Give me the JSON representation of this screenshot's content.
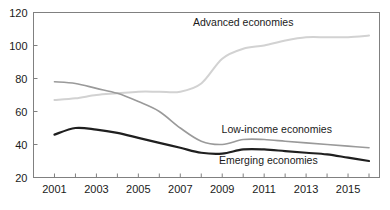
{
  "chart_data": {
    "type": "line",
    "title": "",
    "subtitle": "",
    "xlabel": "",
    "ylabel": "",
    "xlim": [
      2000,
      2016.5
    ],
    "ylim": [
      20,
      120
    ],
    "ytick_values": [
      20,
      40,
      60,
      80,
      100,
      120
    ],
    "ytick_labels": [
      "20",
      "40",
      "60",
      "80",
      "100",
      "120"
    ],
    "xtick_values": [
      2000,
      2001,
      2002,
      2003,
      2004,
      2005,
      2006,
      2007,
      2008,
      2009,
      2010,
      2011,
      2012,
      2013,
      2014,
      2015,
      2016
    ],
    "xtick_labels_shown": [
      "2001",
      "2003",
      "2005",
      "2007",
      "2009",
      "2011",
      "2013",
      "2015"
    ],
    "xtick_labeled_values": [
      2001,
      2003,
      2005,
      2007,
      2009,
      2011,
      2013,
      2015
    ],
    "grid": false,
    "legend_position": "inline-annotations",
    "x": [
      2001,
      2002,
      2003,
      2004,
      2005,
      2006,
      2007,
      2008,
      2009,
      2010,
      2011,
      2012,
      2013,
      2014,
      2015,
      2016
    ],
    "series": [
      {
        "name": "Advanced economies",
        "color": "#d2d2d2",
        "linewidth": 2.0,
        "values": [
          67,
          68,
          70,
          71,
          72,
          72,
          72,
          77,
          92,
          98,
          100,
          103,
          105,
          105,
          105,
          106
        ],
        "annotation": {
          "text": "Advanced economies",
          "x": 2010.0,
          "y": 112
        }
      },
      {
        "name": "Low-income economies",
        "color": "#9a9a9a",
        "linewidth": 1.6,
        "values": [
          78,
          77,
          74,
          71,
          66,
          60,
          50,
          42,
          40,
          43,
          43,
          42,
          41,
          40,
          39,
          38
        ],
        "annotation": {
          "text": "Low-income economies",
          "x": 2011.6,
          "y": 47
        }
      },
      {
        "name": "Emerging economies",
        "color": "#1f1f1f",
        "linewidth": 2.2,
        "values": [
          46,
          50,
          49,
          47,
          44,
          41,
          38,
          35,
          34.5,
          37,
          37,
          36,
          35,
          34,
          32,
          30
        ],
        "annotation": {
          "text": "Emerging economies",
          "x": 2011.2,
          "y": 28
        }
      }
    ],
    "axis_color": "#808080",
    "text_color": "#1a1a1a",
    "background_color": "#ffffff"
  }
}
